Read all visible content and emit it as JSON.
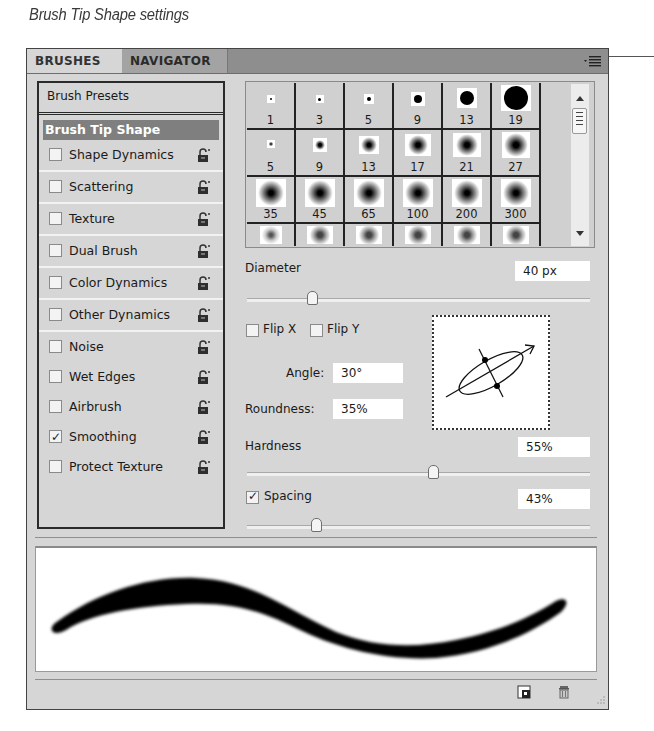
{
  "caption": "Brush Tip Shape settings",
  "panel": {
    "tabs": [
      {
        "label": "BRUSHES",
        "active": true
      },
      {
        "label": "NAVIGATOR",
        "active": false
      }
    ],
    "menu_icon": "panel-menu-icon"
  },
  "sidebar": {
    "presets_button": "Brush Presets",
    "selected_item": "Brush Tip Shape",
    "items": [
      {
        "label": "Shape Dynamics",
        "checked": false,
        "lock": true
      },
      {
        "label": "Scattering",
        "checked": false,
        "lock": true
      },
      {
        "label": "Texture",
        "checked": false,
        "lock": true
      },
      {
        "label": "Dual Brush",
        "checked": false,
        "lock": true
      },
      {
        "label": "Color Dynamics",
        "checked": false,
        "lock": true
      },
      {
        "label": "Other Dynamics",
        "checked": false,
        "lock": true
      },
      {
        "label": "Noise",
        "checked": false,
        "lock": true
      },
      {
        "label": "Wet Edges",
        "checked": false,
        "lock": true
      },
      {
        "label": "Airbrush",
        "checked": false,
        "lock": true
      },
      {
        "label": "Smoothing",
        "checked": true,
        "lock": true
      },
      {
        "label": "Protect Texture",
        "checked": false,
        "lock": true
      }
    ]
  },
  "brush_grid": {
    "rows": [
      [
        "1",
        "3",
        "5",
        "9",
        "13",
        "19"
      ],
      [
        "5",
        "9",
        "13",
        "17",
        "21",
        "27"
      ],
      [
        "35",
        "45",
        "65",
        "100",
        "200",
        "300"
      ],
      [
        "",
        "",
        "",
        "",
        "",
        ""
      ]
    ]
  },
  "settings": {
    "diameter_label": "Diameter",
    "diameter_value": "40 px",
    "diameter_slider_pct": 27,
    "flip_x_label": "Flip X",
    "flip_y_label": "Flip Y",
    "flip_x_checked": false,
    "flip_y_checked": false,
    "angle_label": "Angle:",
    "angle_value": "30°",
    "roundness_label": "Roundness:",
    "roundness_value": "35%",
    "hardness_label": "Hardness",
    "hardness_value": "55%",
    "hardness_slider_pct": 55,
    "spacing_label": "Spacing",
    "spacing_checked": true,
    "spacing_value": "43%",
    "spacing_slider_pct": 28
  },
  "footer": {
    "new_brush_icon": "new-brush-icon",
    "delete_icon": "trash-icon"
  }
}
